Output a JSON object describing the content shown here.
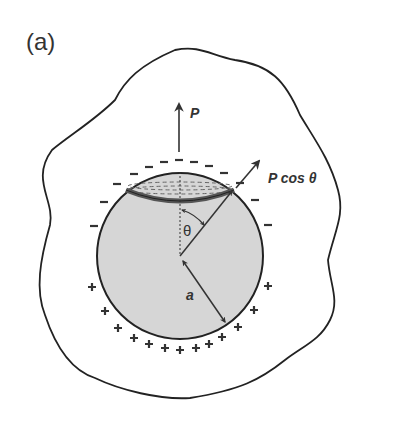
{
  "figure": {
    "panel_label": "(a)",
    "labels": {
      "force": "P",
      "force_component": "P cos θ",
      "angle": "θ",
      "radius": "a"
    },
    "charges": {
      "top_sign": "−",
      "bottom_sign": "+",
      "negative_count": 16,
      "positive_count": 18
    },
    "colors": {
      "sphere_fill": "#d6d6d6",
      "outline": "#222222",
      "band": "#555555",
      "text": "#333333"
    }
  }
}
